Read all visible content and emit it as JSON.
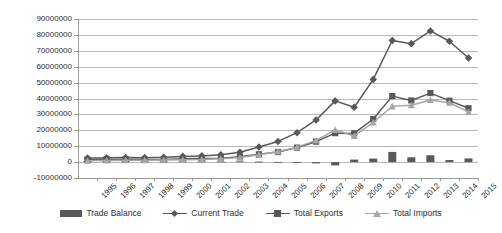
{
  "chart_data": {
    "type": "bar",
    "title": "",
    "subtitle": "",
    "xlabel": "",
    "ylabel": "",
    "ylim": [
      -10000000,
      90000000
    ],
    "ytick_step": 10000000,
    "grid": true,
    "legend_position": "bottom",
    "categories": [
      "1995",
      "1996",
      "1997",
      "1998",
      "1999",
      "2000",
      "2001",
      "2002",
      "2003",
      "2004",
      "2005",
      "2006",
      "2007",
      "2008",
      "2009",
      "2010",
      "2011",
      "2012",
      "2013",
      "2014",
      "2015"
    ],
    "ytick_labels": [
      "90000000",
      "80000000",
      "70000000",
      "60000000",
      "50000000",
      "40000000",
      "30000000",
      "20000000",
      "10000000",
      "0",
      "-10000000"
    ],
    "ytick_values": [
      90000000,
      80000000,
      70000000,
      60000000,
      50000000,
      40000000,
      30000000,
      20000000,
      10000000,
      0,
      -10000000
    ],
    "series": [
      {
        "name": "Trade Balance",
        "type": "bar",
        "color": "#595959",
        "values": [
          700000,
          600000,
          500000,
          400000,
          400000,
          500000,
          600000,
          400000,
          500000,
          300000,
          -400000,
          -300000,
          -800000,
          -2100000,
          1600000,
          2200000,
          6400000,
          3000000,
          4300000,
          1300000,
          2300000
        ]
      },
      {
        "name": "Current Trade",
        "type": "line",
        "marker": "diamond",
        "color": "#595959",
        "values": [
          2500000,
          2700000,
          2900000,
          2800000,
          3000000,
          3600000,
          3900000,
          4600000,
          6200000,
          9500000,
          13000000,
          18500000,
          26500000,
          38500000,
          34500000,
          52000000,
          76500000,
          74500000,
          82500000,
          76000000,
          65500000
        ]
      },
      {
        "name": "Total Exports",
        "type": "line",
        "marker": "square",
        "color": "#595959",
        "values": [
          1600000,
          1700000,
          1700000,
          1600000,
          1700000,
          2050000,
          2250000,
          2500000,
          3350000,
          4900000,
          6300000,
          9100000,
          12850000,
          18200000,
          18050000,
          27100000,
          41500000,
          38750000,
          43400000,
          38650000,
          33900000
        ]
      },
      {
        "name": "Total Imports",
        "type": "line",
        "marker": "triangle",
        "color": "#a6a6a6",
        "values": [
          900000,
          1000000,
          1200000,
          1200000,
          1300000,
          1550000,
          1650000,
          2100000,
          2850000,
          4600000,
          6700000,
          9400000,
          13650000,
          20300000,
          16450000,
          24900000,
          35100000,
          35750000,
          39100000,
          37350000,
          31600000
        ]
      }
    ]
  },
  "legend": {
    "items": [
      {
        "label": "Trade Balance",
        "swatch": "bar-swatch",
        "color": "#595959"
      },
      {
        "label": "Current Trade",
        "swatch": "line-diamond-swatch",
        "color": "#595959"
      },
      {
        "label": "Total Exports",
        "swatch": "line-square-swatch",
        "color": "#595959"
      },
      {
        "label": "Total Imports",
        "swatch": "line-triangle-swatch",
        "color": "#a6a6a6"
      }
    ]
  },
  "style": {
    "grid_color": "#b7b7b7",
    "axis_color": "#9a9a9a",
    "text_color": "#2e2e2e",
    "plot_background": "#ffffff"
  }
}
